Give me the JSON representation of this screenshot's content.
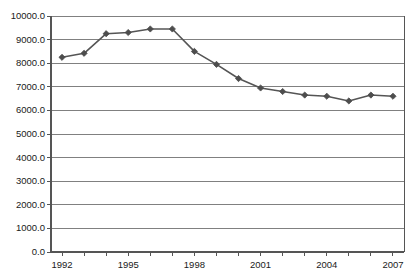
{
  "chart_data": {
    "type": "line",
    "title": "",
    "subtitle": "",
    "xlabel": "",
    "ylabel": "",
    "x": [
      1992,
      1993,
      1994,
      1995,
      1996,
      1997,
      1998,
      1999,
      2000,
      2001,
      2002,
      2003,
      2004,
      2005,
      2006,
      2007
    ],
    "series": [
      {
        "name": "Series 1",
        "values": [
          8250,
          8420,
          9250,
          9300,
          9450,
          9450,
          8500,
          7950,
          7350,
          6950,
          6800,
          6650,
          6600,
          6400,
          6650,
          6600
        ],
        "color": "#555555",
        "marker": "diamond",
        "marker_color": "#4d4d4d",
        "line_width": 1.6
      }
    ],
    "xlim": [
      1991.5,
      2007.5
    ],
    "ylim": [
      0,
      10000
    ],
    "ytick_values": [
      0,
      1000,
      2000,
      3000,
      4000,
      5000,
      6000,
      7000,
      8000,
      9000,
      10000
    ],
    "ytick_labels": [
      "0.0",
      "1000.0",
      "2000.0",
      "3000.0",
      "4000.0",
      "5000.0",
      "6000.0",
      "7000.0",
      "8000.0",
      "9000.0",
      "10000.0"
    ],
    "xtick_values": [
      1992,
      1995,
      1998,
      2001,
      2004,
      2007
    ],
    "xtick_labels": [
      "1992",
      "1995",
      "1998",
      "2001",
      "2004",
      "2007"
    ],
    "xminor_values": [
      1992,
      1993,
      1994,
      1995,
      1996,
      1997,
      1998,
      1999,
      2000,
      2001,
      2002,
      2003,
      2004,
      2005,
      2006,
      2007
    ],
    "grid": {
      "horizontal": true,
      "vertical": false,
      "color": "#808080"
    },
    "legend": {
      "visible": false,
      "position": "none",
      "entries": []
    },
    "axis_color": "#555555",
    "background": "#ffffff",
    "plot_area": {
      "left": 51,
      "top": 16,
      "right": 404,
      "bottom": 252
    }
  }
}
